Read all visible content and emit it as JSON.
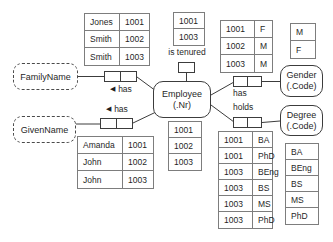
{
  "diagram": {
    "entities": {
      "employee": {
        "line1": "Employee",
        "line2": "(.Nr)"
      },
      "gender": {
        "line1": "Gender",
        "line2": "(.Code)"
      },
      "degree": {
        "line1": "Degree",
        "line2": "(.Code)"
      }
    },
    "value_types": {
      "family_name": {
        "label": "FamilyName"
      },
      "given_name": {
        "label": "GivenName"
      }
    },
    "predicates": {
      "family_has": {
        "label": "has",
        "arrow": "◀"
      },
      "given_has": {
        "label": "has",
        "arrow": "◀"
      },
      "is_tenured": {
        "label": "is tenured"
      },
      "gender_has": {
        "label": "has"
      },
      "degree_holds": {
        "label": "holds"
      }
    },
    "tables": {
      "family_name_facts": {
        "rows": [
          [
            "Jones",
            "1001"
          ],
          [
            "Smith",
            "1002"
          ],
          [
            "Smith",
            "1003"
          ]
        ]
      },
      "given_name_facts": {
        "rows": [
          [
            "Amanda",
            "1001"
          ],
          [
            "John",
            "1002"
          ],
          [
            "John",
            "1003"
          ]
        ]
      },
      "tenured_facts": {
        "rows": [
          [
            "1001"
          ],
          [
            "1003"
          ]
        ]
      },
      "employee_ids": {
        "rows": [
          [
            "1001"
          ],
          [
            "1002"
          ],
          [
            "1003"
          ]
        ]
      },
      "gender_facts": {
        "rows": [
          [
            "1001",
            "F"
          ],
          [
            "1002",
            "M"
          ],
          [
            "1003",
            "M"
          ]
        ]
      },
      "gender_codes": {
        "rows": [
          [
            "M"
          ],
          [
            "F"
          ]
        ]
      },
      "degree_facts": {
        "rows": [
          [
            "1001",
            "BA"
          ],
          [
            "1001",
            "PhD"
          ],
          [
            "1003",
            "BEng"
          ],
          [
            "1003",
            "BS"
          ],
          [
            "1003",
            "MS"
          ],
          [
            "1003",
            "PhD"
          ]
        ]
      },
      "degree_codes": {
        "rows": [
          [
            "BA"
          ],
          [
            "BEng"
          ],
          [
            "BS"
          ],
          [
            "MS"
          ],
          [
            "PhD"
          ]
        ]
      }
    },
    "colors": {
      "line": "#3c3c3c",
      "table_border": "#7d7d7d",
      "text": "#1f1f1f",
      "background": "#ffffff"
    }
  }
}
